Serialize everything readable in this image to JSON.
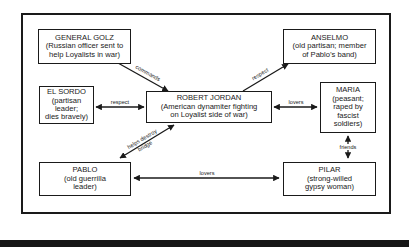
{
  "diagram": {
    "type": "character-relationship-map",
    "nodes": [
      {
        "id": "golz",
        "name": "GENERAL GOLZ",
        "desc_lines": [
          "(Russian officer sent to",
          "help Loyalists in war)"
        ]
      },
      {
        "id": "anselmo",
        "name": "ANSELMO",
        "desc_lines": [
          "(old partisan; member",
          "of Pablo’s band)"
        ]
      },
      {
        "id": "el_sordo",
        "name": "EL SORDO",
        "desc_lines": [
          "(partisan",
          "leader;",
          "dies bravely)"
        ]
      },
      {
        "id": "robert_jordan",
        "name": "ROBERT JORDAN",
        "desc_lines": [
          "(American dynamiter fighting",
          "on Loyalist side of war)"
        ]
      },
      {
        "id": "maria",
        "name": "MARIA",
        "desc_lines": [
          "(peasant;",
          "raped by",
          "fascist",
          "soldiers)"
        ]
      },
      {
        "id": "pablo",
        "name": "PABLO",
        "desc_lines": [
          "(old guerrilla",
          "leader)"
        ]
      },
      {
        "id": "pilar",
        "name": "PILAR",
        "desc_lines": [
          "(strong-willed",
          "gypsy woman)"
        ]
      }
    ],
    "edges": [
      {
        "from": "golz",
        "to": "robert_jordan",
        "label": "commands",
        "direction": "forward"
      },
      {
        "from": "robert_jordan",
        "to": "anselmo",
        "label": "respect",
        "direction": "forward"
      },
      {
        "from": "el_sordo",
        "to": "robert_jordan",
        "label": "respect",
        "direction": "both"
      },
      {
        "from": "robert_jordan",
        "to": "maria",
        "label": "lovers",
        "direction": "both"
      },
      {
        "from": "pablo",
        "to": "robert_jordan",
        "label_lines": [
          "helps destroy",
          "bridge"
        ],
        "direction": "both"
      },
      {
        "from": "maria",
        "to": "pilar",
        "label": "friends",
        "direction": "both"
      },
      {
        "from": "pablo",
        "to": "pilar",
        "label": "lovers",
        "direction": "both"
      }
    ]
  }
}
